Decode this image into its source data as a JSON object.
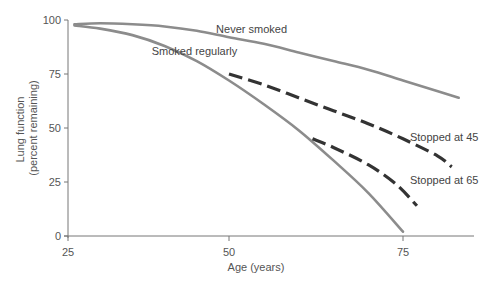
{
  "chart_data": {
    "type": "line",
    "title": "",
    "xlabel": "Age (years)",
    "ylabel": "Lung function\n(percent remaining)",
    "ylabel_lines": [
      "Lung function",
      "(percent remaining)"
    ],
    "xlim": [
      25,
      84
    ],
    "ylim": [
      0,
      100
    ],
    "xticks": [
      25,
      50,
      75
    ],
    "yticks": [
      0,
      25,
      50,
      75,
      100
    ],
    "grid": false,
    "legend": "inline labels",
    "series": [
      {
        "name": "Never smoked",
        "style": "solid",
        "color": "#8c8c8c",
        "x": [
          26,
          30,
          35,
          40,
          45,
          50,
          55,
          60,
          65,
          70,
          75,
          80,
          83
        ],
        "y": [
          98,
          98.5,
          98,
          97,
          95,
          92,
          89,
          85,
          81,
          77,
          72,
          67,
          64
        ]
      },
      {
        "name": "Smoked regularly",
        "style": "solid",
        "color": "#8c8c8c",
        "x": [
          26,
          30,
          35,
          40,
          45,
          50,
          55,
          60,
          65,
          70,
          75
        ],
        "y": [
          97.5,
          96,
          93,
          88,
          81,
          72,
          61,
          49,
          35,
          20,
          2
        ]
      },
      {
        "name": "Stopped at 45",
        "style": "dashed",
        "color": "#333333",
        "x": [
          50,
          55,
          60,
          65,
          70,
          75,
          80,
          82
        ],
        "y": [
          75,
          70,
          64,
          58,
          52,
          45,
          37,
          32
        ]
      },
      {
        "name": "Stopped at 65",
        "style": "dashed",
        "color": "#333333",
        "x": [
          62,
          65,
          70,
          74,
          77
        ],
        "y": [
          45,
          41,
          33,
          24,
          14
        ]
      }
    ],
    "annotations": [
      {
        "text": "Never smoked",
        "x": 48,
        "y": 94
      },
      {
        "text": "Smoked regularly",
        "x": 38,
        "y": 84
      },
      {
        "text": "Stopped at 45",
        "x": 76,
        "y": 44
      },
      {
        "text": "Stopped at 65",
        "x": 76,
        "y": 24
      }
    ]
  }
}
